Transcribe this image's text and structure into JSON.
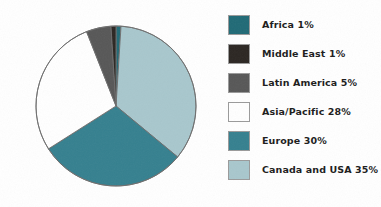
{
  "figure": {
    "background_color": "#ffffff",
    "stroke_color": "#6d6d6d"
  },
  "legend": {
    "position": "right",
    "items": [
      {
        "label": "Africa 1%",
        "region": "Africa",
        "percent": 1,
        "color": "#206a76"
      },
      {
        "label": "Middle East 1%",
        "region": "Middle East",
        "percent": 1,
        "color": "#2b2622"
      },
      {
        "label": "Latin America 5%",
        "region": "Latin America",
        "percent": 5,
        "color": "#575757"
      },
      {
        "label": "Asia/Pacific 28%",
        "region": "Asia/Pacific",
        "percent": 28,
        "color": "#ffffff"
      },
      {
        "label": "Europe 30%",
        "region": "Europe",
        "percent": 30,
        "color": "#35808f"
      },
      {
        "label": "Canada and USA 35%",
        "region": "Canada and USA",
        "percent": 35,
        "color": "#a8c7cd"
      }
    ]
  },
  "chart_data": {
    "type": "pie",
    "title": "",
    "xlabel": "",
    "ylabel": "",
    "legend_position": "right",
    "grid": false,
    "start_angle_deg": 0,
    "direction": "clockwise",
    "units": "percent",
    "total": 100,
    "labels": [
      "Africa",
      "Canada and USA",
      "Europe",
      "Asia/Pacific",
      "Latin America",
      "Middle East"
    ],
    "values": [
      1,
      35,
      30,
      28,
      5,
      1
    ],
    "colors": [
      "#206a76",
      "#a8c7cd",
      "#35808f",
      "#ffffff",
      "#575757",
      "#2b2622"
    ],
    "slices": [
      {
        "label": "Africa",
        "value": 1,
        "color": "#206a76",
        "order": 1
      },
      {
        "label": "Canada and USA",
        "value": 35,
        "color": "#a8c7cd",
        "order": 2
      },
      {
        "label": "Europe",
        "value": 30,
        "color": "#35808f",
        "order": 3
      },
      {
        "label": "Asia/Pacific",
        "value": 28,
        "color": "#ffffff",
        "order": 4
      },
      {
        "label": "Latin America",
        "value": 5,
        "color": "#575757",
        "order": 5
      },
      {
        "label": "Middle East",
        "value": 1,
        "color": "#2b2622",
        "order": 6
      }
    ]
  }
}
